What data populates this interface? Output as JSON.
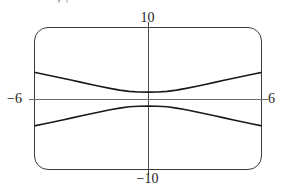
{
  "figure": {
    "caption_remnant": "y₁",
    "background_color": "#ffffff",
    "frame_color": "#3a3a3a",
    "axis_color": "#4a4a4a",
    "curve_color": "#1a1a1a"
  },
  "labels": {
    "y_max": "10",
    "y_min": "−10",
    "x_min": "−6",
    "x_max": "6"
  },
  "chart_data": {
    "type": "line",
    "title": "",
    "subtitle": "",
    "xlabel": "",
    "ylabel": "",
    "xlim": [
      -6,
      6
    ],
    "ylim": [
      -10,
      10
    ],
    "grid": false,
    "legend": null,
    "axes_shown": [
      "x-axis",
      "y-axis"
    ],
    "tick_labels": {
      "x": [
        "−6",
        "6"
      ],
      "y": [
        "−10",
        "10"
      ]
    },
    "annotations": [],
    "series": [
      {
        "name": "upper branch",
        "points": [
          [
            -6.0,
            3.75
          ],
          [
            -5.5,
            3.48
          ],
          [
            -5.0,
            3.2
          ],
          [
            -4.5,
            2.92
          ],
          [
            -4.0,
            2.63
          ],
          [
            -3.5,
            2.34
          ],
          [
            -3.0,
            2.05
          ],
          [
            -2.5,
            1.77
          ],
          [
            -2.0,
            1.5
          ],
          [
            -1.5,
            1.26
          ],
          [
            -1.0,
            1.08
          ],
          [
            -0.5,
            1.0
          ],
          [
            0.0,
            0.98
          ],
          [
            0.5,
            1.0
          ],
          [
            1.0,
            1.08
          ],
          [
            1.5,
            1.26
          ],
          [
            2.0,
            1.5
          ],
          [
            2.5,
            1.77
          ],
          [
            3.0,
            2.05
          ],
          [
            3.5,
            2.34
          ],
          [
            4.0,
            2.63
          ],
          [
            4.5,
            2.92
          ],
          [
            5.0,
            3.2
          ],
          [
            5.5,
            3.48
          ],
          [
            6.0,
            3.75
          ]
        ]
      },
      {
        "name": "lower branch",
        "points": [
          [
            -6.0,
            -3.75
          ],
          [
            -5.5,
            -3.48
          ],
          [
            -5.0,
            -3.2
          ],
          [
            -4.5,
            -2.92
          ],
          [
            -4.0,
            -2.63
          ],
          [
            -3.5,
            -2.34
          ],
          [
            -3.0,
            -2.05
          ],
          [
            -2.5,
            -1.77
          ],
          [
            -2.0,
            -1.5
          ],
          [
            -1.5,
            -1.26
          ],
          [
            -1.0,
            -1.08
          ],
          [
            -0.5,
            -1.0
          ],
          [
            0.0,
            -0.98
          ],
          [
            0.5,
            -1.0
          ],
          [
            1.0,
            -1.08
          ],
          [
            1.5,
            -1.26
          ],
          [
            2.0,
            -1.5
          ],
          [
            2.5,
            -1.77
          ],
          [
            3.0,
            -2.05
          ],
          [
            3.5,
            -2.34
          ],
          [
            4.0,
            -2.63
          ],
          [
            4.5,
            -2.92
          ],
          [
            5.0,
            -3.2
          ],
          [
            5.5,
            -3.48
          ],
          [
            6.0,
            -3.75
          ]
        ]
      }
    ]
  }
}
